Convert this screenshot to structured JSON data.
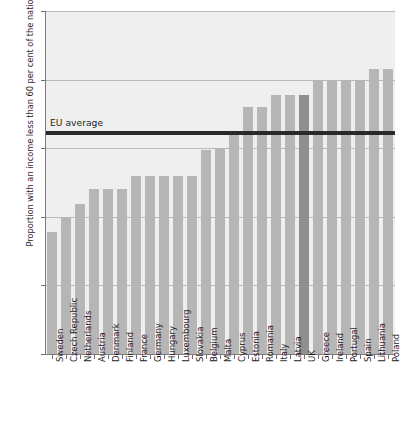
{
  "chart_data": {
    "type": "bar",
    "title": "",
    "xlabel": "",
    "ylabel": "Proportion with an income less than 60 per cent of the national median",
    "ylim": [
      0,
      25
    ],
    "yticks": [
      0,
      5,
      10,
      15,
      20,
      25
    ],
    "grid": true,
    "legend_position": "none",
    "categories": [
      "Sweden",
      "Czech Republic",
      "Netherlands",
      "Austria",
      "Denmark",
      "Finland",
      "France",
      "Germany",
      "Hungary",
      "Luxembourg",
      "Slovakia",
      "Belgium",
      "Malta",
      "Cyprus",
      "Estonia",
      "Romania",
      "Italy",
      "Latvia",
      "UK",
      "Greece",
      "Ireland",
      "Portugal",
      "Spain",
      "Lithuania",
      "Poland"
    ],
    "values": [
      8.9,
      10.0,
      10.9,
      12.0,
      12.0,
      12.0,
      13.0,
      13.0,
      13.0,
      13.0,
      13.0,
      14.9,
      15.0,
      16.1,
      18.0,
      18.0,
      18.9,
      18.9,
      18.9,
      20.0,
      20.0,
      20.0,
      20.0,
      20.8,
      20.8
    ],
    "highlight_category": "UK",
    "annotations": [
      {
        "label": "EU average",
        "value": 16.1,
        "type": "hline"
      }
    ],
    "colors": {
      "bar": "#b6b6b6",
      "bar_highlight": "#8f8f8f",
      "plot_background": "#efefef",
      "gridline": "#b9b9b9",
      "annotation_line": "#2a2a2a",
      "axis": "#7d7d7d",
      "text": "#1e1e1e"
    }
  }
}
